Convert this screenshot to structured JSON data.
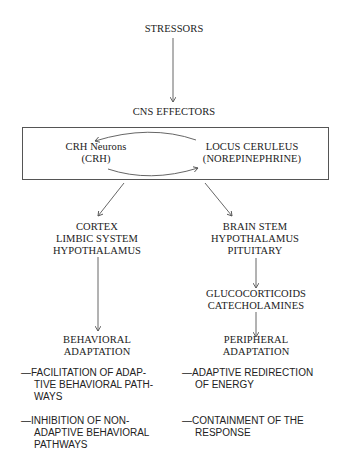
{
  "diagram": {
    "top": {
      "label": "STRESSORS"
    },
    "effectors": {
      "label": "CNS EFFECTORS"
    },
    "box": {
      "left_node": {
        "line1": "CRH Neurons",
        "line2": "(CRH)"
      },
      "right_node": {
        "line1": "LOCUS CERULEUS",
        "line2": "(NOREPINEPHRINE)"
      }
    },
    "left_branch": {
      "target": {
        "line1": "CORTEX",
        "line2": "LIMBIC SYSTEM",
        "line3": "HYPOTHALAMUS"
      },
      "outcome": {
        "line1": "BEHAVIORAL",
        "line2": "ADAPTATION"
      },
      "bullets": [
        {
          "line1": "—FACILITATION OF ADAP-",
          "line2": "TIVE BEHAVIORAL PATH-",
          "line3": "WAYS"
        },
        {
          "line1": "—INHIBITION OF NON-",
          "line2": "ADAPTIVE BEHAVIORAL",
          "line3": "PATHWAYS"
        }
      ]
    },
    "right_branch": {
      "target": {
        "line1": "BRAIN STEM",
        "line2": "HYPOTHALAMUS",
        "line3": "PITUITARY"
      },
      "mediators": {
        "line1": "GLUCOCORTICOIDS",
        "line2": "CATECHOLAMINES"
      },
      "outcome": {
        "line1": "PERIPHERAL",
        "line2": "ADAPTATION"
      },
      "bullets": [
        {
          "line1": "—ADAPTIVE REDIRECTION",
          "line2": "OF ENERGY"
        },
        {
          "line1": "—CONTAINMENT OF THE",
          "line2": "RESPONSE"
        }
      ]
    },
    "colors": {
      "line": "#555555",
      "text": "#222222",
      "background": "#ffffff"
    }
  }
}
